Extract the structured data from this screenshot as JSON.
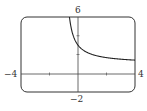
{
  "chart_data": {
    "type": "line",
    "title": "",
    "xlabel": "",
    "ylabel": "",
    "xlim": [
      -4,
      4
    ],
    "ylim": [
      -2,
      6
    ],
    "tick_labels": {
      "x_min": "−4",
      "x_max": "4",
      "y_max": "6",
      "y_min": "−2"
    },
    "x_ticks": [
      -2,
      2
    ],
    "y_ticks": [
      2,
      4
    ],
    "grid": false,
    "series": [
      {
        "name": "curve",
        "x": [
          -0.6,
          -0.5,
          -0.25,
          0,
          0.5,
          1,
          1.5,
          2,
          2.5,
          3,
          3.5,
          4
        ],
        "values": [
          6.0,
          5.0,
          2.6,
          3.0,
          2.33,
          2.0,
          1.8,
          1.67,
          1.57,
          1.5,
          1.44,
          1.4
        ]
      }
    ],
    "legend": null
  }
}
